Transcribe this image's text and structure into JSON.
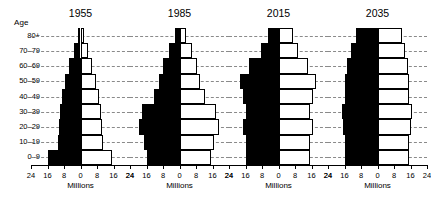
{
  "chart_data": {
    "type": "bar",
    "subtype": "population-pyramid",
    "title": "",
    "xlabel": "Millions",
    "ylabel": "Age",
    "categories": [
      "0–9",
      "10–19",
      "20–29",
      "30–39",
      "40–49",
      "50–59",
      "60–69",
      "70–79",
      "80+"
    ],
    "axis_tick_labels": [
      "24",
      "16",
      "8",
      "0",
      "8",
      "16",
      "24"
    ],
    "axis_tick_values": [
      -24,
      -16,
      -8,
      0,
      8,
      16,
      24
    ],
    "xlim": [
      -24,
      24
    ],
    "grid": true,
    "legend": "none",
    "male_color": "#000000",
    "female_color": "#ffffff",
    "male_side": "left",
    "female_side": "right",
    "panels": [
      {
        "title": "1955",
        "series": [
          {
            "name": "Male",
            "values": [
              16.0,
              11.0,
              10.5,
              10.0,
              9.0,
              7.5,
              5.5,
              3.2,
              1.2
            ]
          },
          {
            "name": "Female",
            "values": [
              15.5,
              10.8,
              10.5,
              10.0,
              9.0,
              7.6,
              5.8,
              3.6,
              1.6
            ]
          }
        ]
      },
      {
        "title": "1985",
        "series": [
          {
            "name": "Male",
            "values": [
              16.0,
              17.0,
              19.5,
              18.0,
              12.5,
              10.0,
              8.0,
              5.0,
              2.0
            ]
          },
          {
            "name": "Female",
            "values": [
              15.5,
              16.5,
              19.0,
              17.5,
              12.5,
              10.0,
              8.5,
              6.0,
              3.2
            ]
          }
        ]
      },
      {
        "title": "2015",
        "series": [
          {
            "name": "Male",
            "values": [
              16.0,
              16.0,
              17.0,
              16.0,
              17.0,
              18.5,
              14.5,
              8.5,
              5.0
            ]
          },
          {
            "name": "Female",
            "values": [
              15.5,
              15.5,
              16.5,
              15.5,
              16.5,
              18.0,
              14.5,
              9.5,
              7.0
            ]
          }
        ]
      },
      {
        "title": "2035",
        "series": [
          {
            "name": "Male",
            "values": [
              16.0,
              16.0,
              16.5,
              17.0,
              16.0,
              16.0,
              15.0,
              13.0,
              10.5
            ]
          },
          {
            "name": "Female",
            "values": [
              15.5,
              15.5,
              16.0,
              16.5,
              15.5,
              15.5,
              15.0,
              13.5,
              12.0
            ]
          }
        ]
      }
    ]
  }
}
